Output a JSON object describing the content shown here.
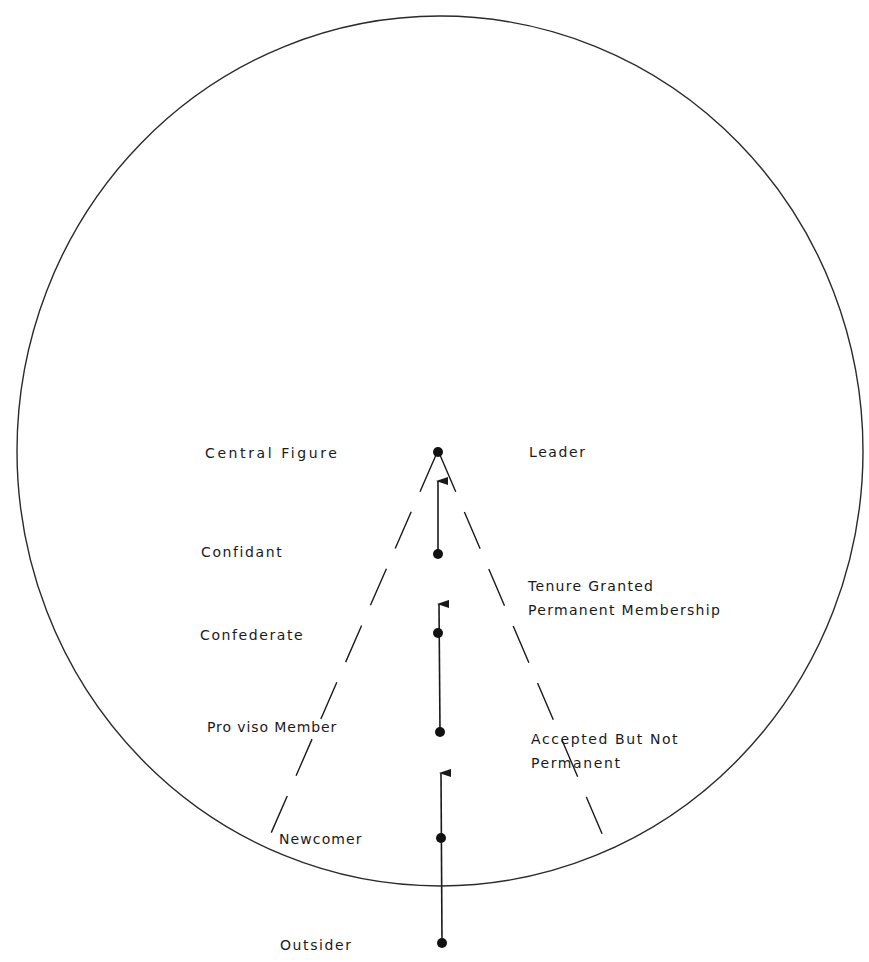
{
  "diagram": {
    "type": "membership-progression",
    "colors": {
      "line": "#2a2a2a",
      "text": "#1a1a1a",
      "background": "#ffffff"
    },
    "boundary": {
      "shape": "circle",
      "meaning": "group boundary"
    },
    "stages_left": [
      {
        "id": "central-figure",
        "label": "Central Figure"
      },
      {
        "id": "confidant",
        "label": "Confidant"
      },
      {
        "id": "confederate",
        "label": "Confederate"
      },
      {
        "id": "proviso-member",
        "label": "Pro viso Member"
      },
      {
        "id": "newcomer",
        "label": "Newcomer"
      },
      {
        "id": "outsider",
        "label": "Outsider"
      }
    ],
    "labels_right": [
      {
        "id": "leader",
        "label": "Leader"
      },
      {
        "id": "tenure-granted",
        "label": "Tenure Granted\nPermanent Membership"
      },
      {
        "id": "accepted-not-permanent",
        "label": "Accepted But Not\nPermanent"
      }
    ]
  }
}
